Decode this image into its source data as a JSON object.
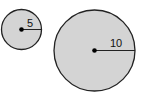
{
  "diagram": {
    "circles": [
      {
        "id": "small",
        "radius_label": "5",
        "cx": 21.5,
        "cy": 29.5,
        "r": 20
      },
      {
        "id": "large",
        "radius_label": "10",
        "cx": 94.5,
        "cy": 50.5,
        "r": 40.5
      }
    ],
    "colors": {
      "fill": "#d4d4d4",
      "stroke": "#222222"
    }
  }
}
